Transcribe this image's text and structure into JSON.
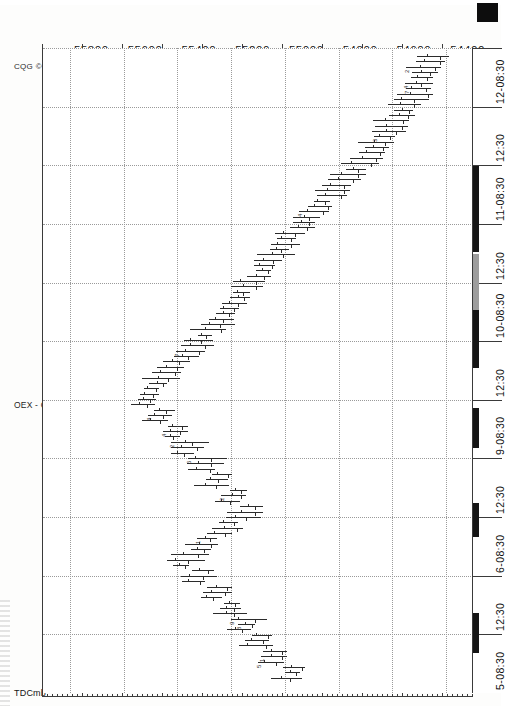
{
  "meta": {
    "copyright": "CQG © 1999",
    "symbol_caption": "OEX - OEX Index (S&P 100), 15 Min",
    "study_label": "TDCmb",
    "orientation": "page rotated 90° counter-clockwise",
    "marker_icon": "black-square-marker"
  },
  "chart_data": {
    "type": "bar",
    "subtype": "ohlc-bar-chart",
    "title": "OEX - OEX Index (S&P 100), 15 Min",
    "xlabel": "Time",
    "ylabel": "Price",
    "grid": true,
    "legend": "none",
    "price_axis": {
      "ticks": [
        "55800",
        "55600",
        "55400",
        "55200",
        "55000",
        "54800",
        "54600",
        "54400"
      ],
      "values": [
        55800,
        55600,
        55400,
        55200,
        55000,
        54800,
        54600,
        54400
      ],
      "range": [
        54300,
        55900
      ],
      "direction": "descending left-to-right on rotated page"
    },
    "time_axis": {
      "ticks": [
        "5-08:30",
        "12:30",
        "6-08:30",
        "12:30",
        "9-08:30",
        "12:30",
        "10-08:30",
        "12:30",
        "11-08:30",
        "12:30",
        "12-08:30"
      ],
      "interval": "15 Min",
      "sessions": [
        "5",
        "6",
        "9",
        "10",
        "11",
        "12"
      ]
    },
    "categories": [
      "5-08:30",
      "5-09:30",
      "5-10:30",
      "5-11:30",
      "5-12:30",
      "5-13:30",
      "5-14:30",
      "6-08:30",
      "6-09:30",
      "6-10:30",
      "6-11:30",
      "6-12:30",
      "6-13:30",
      "6-14:30",
      "9-08:30",
      "9-09:30",
      "9-10:30",
      "9-11:30",
      "9-12:30",
      "9-13:30",
      "9-14:30",
      "10-08:30",
      "10-09:30",
      "10-10:30",
      "10-11:30",
      "10-12:30",
      "10-13:30",
      "10-14:30",
      "11-08:30",
      "11-09:30",
      "11-10:30",
      "11-11:30",
      "11-12:30",
      "11-13:30",
      "11-14:30",
      "12-08:30",
      "12-09:30",
      "12-10:30",
      "12-11:30"
    ],
    "series": [
      {
        "name": "OEX price",
        "note": "approximate OHLC read off 15-minute bars",
        "values": [
          54460,
          54490,
          54520,
          54560,
          54610,
          54650,
          54700,
          54760,
          54820,
          54870,
          54930,
          54990,
          55040,
          55080,
          55140,
          55190,
          55240,
          55300,
          55350,
          55420,
          55480,
          55520,
          55470,
          55410,
          55360,
          55300,
          55250,
          55190,
          55140,
          55220,
          55300,
          55370,
          55320,
          55260,
          55200,
          55150,
          55100,
          55040,
          54980
        ]
      }
    ],
    "annotations_note": "small numeric TD Combo count digits printed beside individual bars"
  },
  "bars": [
    {
      "t": 4,
      "hi": 55380,
      "lo": 55300,
      "o": 55310,
      "c": 55370
    },
    {
      "t": 10,
      "hi": 55330,
      "lo": 55240,
      "o": 55250,
      "c": 55320
    },
    {
      "t": 16,
      "hi": 55300,
      "lo": 55210,
      "o": 55290,
      "c": 55225
    },
    {
      "t": 22,
      "hi": 55270,
      "lo": 55185,
      "o": 55255,
      "c": 55200
    }
  ],
  "ui": {
    "time_labels": [
      "12-08:30",
      "12:30",
      "11-08:30",
      "12:30",
      "10-08:30",
      "12:30",
      "9-08:30",
      "12:30",
      "6-08:30",
      "12:30",
      "5-08:30"
    ]
  }
}
